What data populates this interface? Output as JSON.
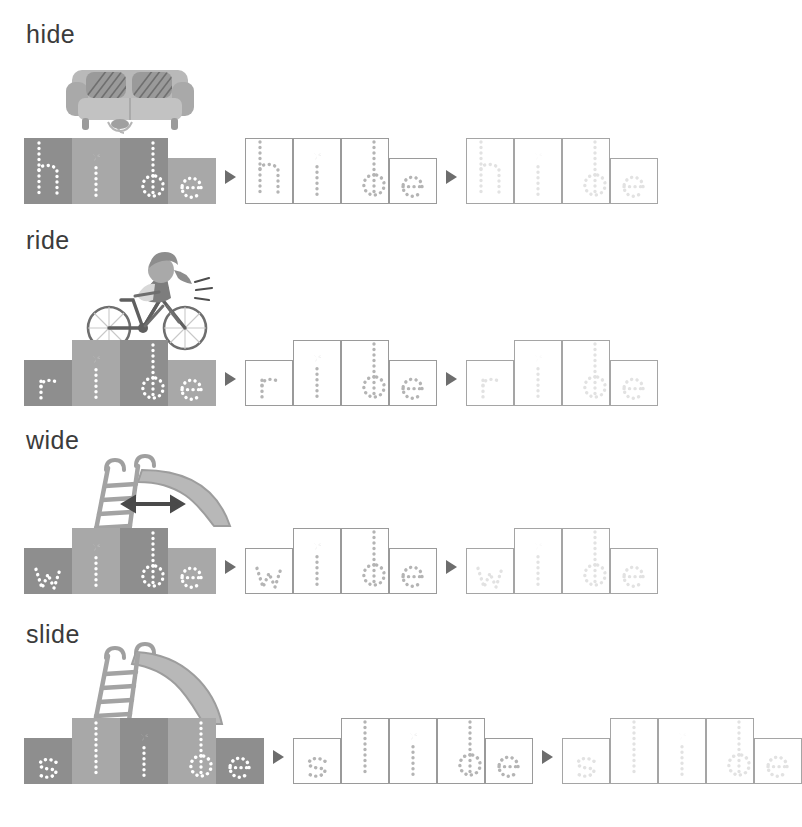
{
  "worksheet": {
    "title_hidden": "",
    "caption": "",
    "stage_count": 3,
    "colors": {
      "box_tone_a": "#8e8e8e",
      "box_tone_b": "#a8a8a8",
      "stage1_letter": "#ffffff",
      "stage2_letter": "#b4b4b4",
      "stage2_border": "#9a9a9a",
      "stage3_letter": "#e2e2e2",
      "stage3_border": "#a5a5a5",
      "arrow": "#6d6d6d",
      "word_label": "#3b3b3b"
    }
  },
  "rows": [
    {
      "word": "hide",
      "label": "hide",
      "illustration": "sofa-icon",
      "illustration_name": "sofa",
      "letters": [
        {
          "char": "h",
          "tall": true,
          "tone": "a"
        },
        {
          "char": "i",
          "tall": true,
          "tone": "b"
        },
        {
          "char": "d",
          "tall": true,
          "tone": "a"
        },
        {
          "char": "e",
          "tall": false,
          "tone": "b"
        }
      ]
    },
    {
      "word": "ride",
      "label": "ride",
      "illustration": "bicycle-rider-icon",
      "illustration_name": "girl riding bicycle",
      "letters": [
        {
          "char": "r",
          "tall": false,
          "tone": "a"
        },
        {
          "char": "i",
          "tall": true,
          "tone": "b"
        },
        {
          "char": "d",
          "tall": true,
          "tone": "a"
        },
        {
          "char": "e",
          "tall": false,
          "tone": "b"
        }
      ]
    },
    {
      "word": "wide",
      "label": "wide",
      "illustration": "wide-slide-icon",
      "illustration_name": "slide with width arrow",
      "letters": [
        {
          "char": "w",
          "tall": false,
          "tone": "a"
        },
        {
          "char": "i",
          "tall": true,
          "tone": "b"
        },
        {
          "char": "d",
          "tall": true,
          "tone": "a"
        },
        {
          "char": "e",
          "tall": false,
          "tone": "b"
        }
      ]
    },
    {
      "word": "slide",
      "label": "slide",
      "illustration": "slide-icon",
      "illustration_name": "playground slide",
      "letters": [
        {
          "char": "s",
          "tall": false,
          "tone": "a"
        },
        {
          "char": "l",
          "tall": true,
          "tone": "b"
        },
        {
          "char": "i",
          "tall": true,
          "tone": "a"
        },
        {
          "char": "d",
          "tall": true,
          "tone": "b"
        },
        {
          "char": "e",
          "tall": false,
          "tone": "a"
        }
      ]
    }
  ]
}
